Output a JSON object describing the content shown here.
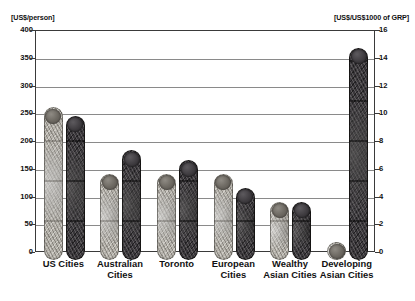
{
  "chart_data": {
    "type": "bar",
    "title": "",
    "categories": [
      "US Cities",
      "Australian\nCities",
      "Toronto",
      "European\nCities",
      "Wealthy\nAsian Cities",
      "Developing\nAsian Cities"
    ],
    "series": [
      {
        "name": "US$/person",
        "axis": "left",
        "color": "#b5b2ab",
        "values": [
          275,
          155,
          155,
          155,
          105,
          32
        ]
      },
      {
        "name": "US$/US$1000 of GRP",
        "axis": "right",
        "color": "#39363a",
        "values": [
          10.4,
          7.9,
          7.2,
          5.2,
          4.2,
          15.3
        ]
      }
    ],
    "ylabel_left": "[US$/person]",
    "ylabel_right": "[US$/US$1000 of GRP]",
    "xlabel": "",
    "ylim_left": [
      0,
      400
    ],
    "ylim_right": [
      0,
      16
    ],
    "yticks_left": [
      0,
      50,
      100,
      150,
      200,
      250,
      300,
      350,
      400
    ],
    "yticks_right": [
      0,
      2,
      4,
      6,
      8,
      10,
      12,
      14,
      16
    ],
    "grid": true,
    "legend": "none"
  },
  "axes": {
    "left_caption": "[US$/person]",
    "right_caption": "[US$/US$1000 of GRP]",
    "left_ticks": [
      "400",
      "350",
      "300",
      "250",
      "200",
      "150",
      "100",
      "50",
      "0"
    ],
    "right_ticks": [
      "16",
      "14",
      "12",
      "10",
      "8",
      "6",
      "4",
      "2",
      "0"
    ]
  },
  "categories": [
    {
      "label": "US Cities"
    },
    {
      "label": "Australian\nCities"
    },
    {
      "label": "Toronto"
    },
    {
      "label": "European\nCities"
    },
    {
      "label": "Wealthy\nAsian Cities"
    },
    {
      "label": "Developing\nAsian Cities"
    }
  ]
}
